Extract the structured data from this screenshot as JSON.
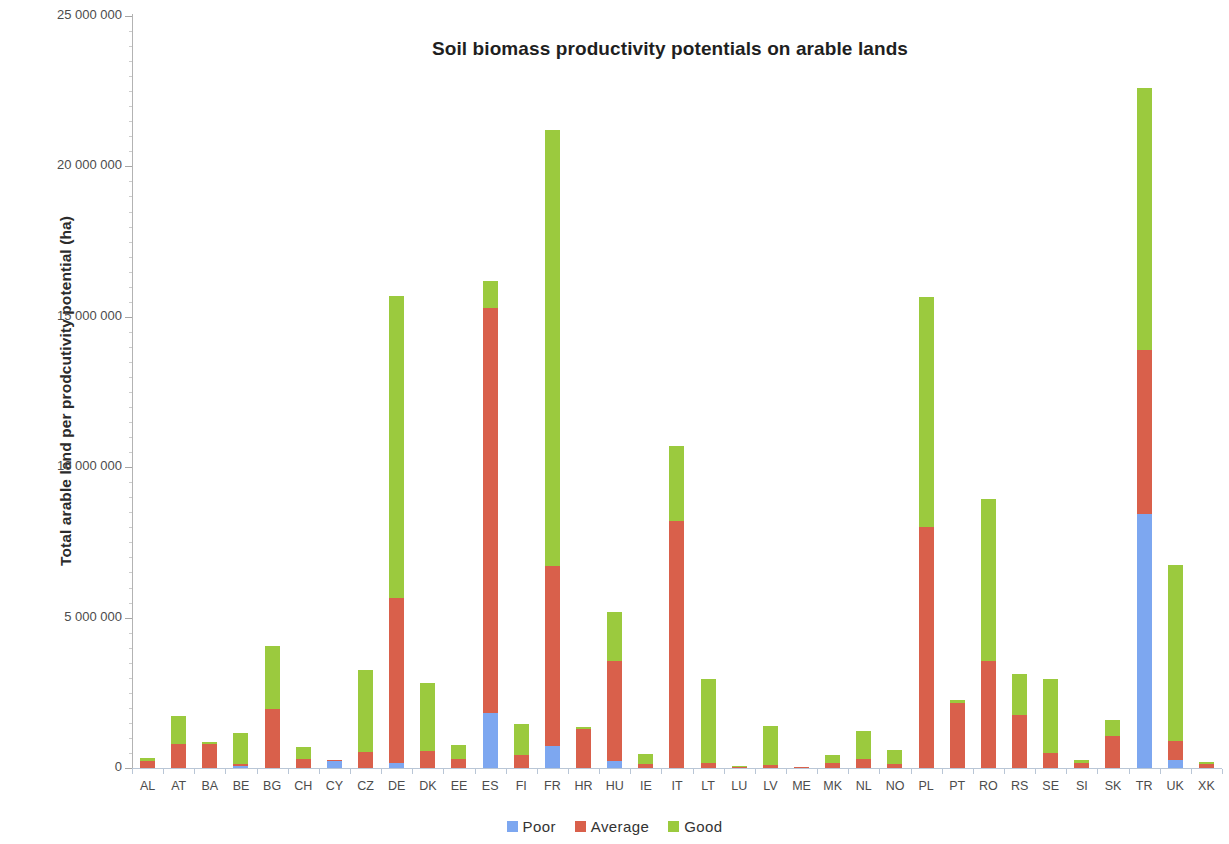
{
  "chart_data": {
    "type": "bar",
    "stacked": true,
    "title": "Soil biomass productivity potentials on arable lands",
    "xlabel": "",
    "ylabel": "Total arable land per prodcutivity potential (ha)",
    "ylim": [
      0,
      25000000
    ],
    "ytick_labels": [
      "0",
      "5 000 000",
      "10 000 000",
      "15 000 000",
      "20 000 000",
      "25 000 000"
    ],
    "ytick_values": [
      0,
      5000000,
      10000000,
      15000000,
      20000000,
      25000000
    ],
    "grid": false,
    "legend_position": "bottom",
    "categories": [
      "AL",
      "AT",
      "BA",
      "BE",
      "BG",
      "CH",
      "CY",
      "CZ",
      "DE",
      "DK",
      "EE",
      "ES",
      "FI",
      "FR",
      "HR",
      "HU",
      "IE",
      "IT",
      "LT",
      "LU",
      "LV",
      "ME",
      "MK",
      "NL",
      "NO",
      "PL",
      "PT",
      "RO",
      "RS",
      "SE",
      "SI",
      "SK",
      "TR",
      "UK",
      "XK"
    ],
    "series": [
      {
        "name": "Poor",
        "color": "#7da7f0",
        "values": [
          0,
          0,
          0,
          80000,
          0,
          0,
          220000,
          0,
          170000,
          0,
          0,
          1830000,
          0,
          720000,
          0,
          230000,
          0,
          0,
          0,
          0,
          0,
          0,
          0,
          0,
          0,
          0,
          0,
          0,
          0,
          0,
          0,
          0,
          8450000,
          250000,
          0
        ]
      },
      {
        "name": "Average",
        "color": "#d9604b",
        "values": [
          220000,
          790000,
          800000,
          70000,
          1950000,
          300000,
          60000,
          520000,
          5480000,
          550000,
          300000,
          13470000,
          420000,
          5980000,
          1300000,
          3330000,
          120000,
          8200000,
          180000,
          40000,
          110000,
          20000,
          160000,
          290000,
          120000,
          8000000,
          2150000,
          3550000,
          1750000,
          500000,
          170000,
          1050000,
          5450000,
          650000,
          150000
        ]
      },
      {
        "name": "Good",
        "color": "#9bca3e",
        "values": [
          110000,
          930000,
          80000,
          1020000,
          2100000,
          400000,
          0,
          2750000,
          10030000,
          2270000,
          470000,
          900000,
          1050000,
          14500000,
          50000,
          1620000,
          360000,
          2500000,
          2770000,
          20000,
          1290000,
          0,
          260000,
          930000,
          480000,
          7650000,
          100000,
          5400000,
          1370000,
          2450000,
          80000,
          550000,
          8700000,
          5850000,
          50000
        ]
      }
    ]
  },
  "legend": {
    "items": [
      {
        "label": "Poor",
        "color": "#7da7f0"
      },
      {
        "label": "Average",
        "color": "#d9604b"
      },
      {
        "label": "Good",
        "color": "#9bca3e"
      }
    ]
  }
}
